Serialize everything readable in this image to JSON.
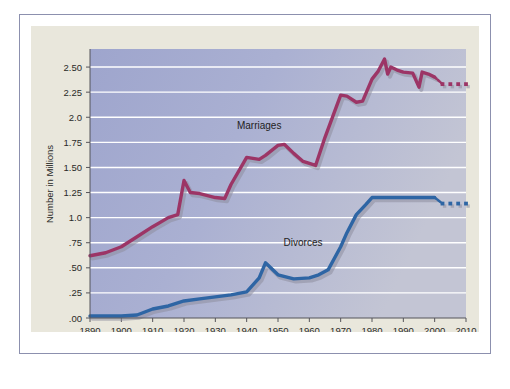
{
  "chart_data": {
    "type": "line",
    "title": "",
    "xlabel": "Year",
    "ylabel": "Number in Millions",
    "xlim": [
      1890,
      2010
    ],
    "ylim": [
      0,
      2.68
    ],
    "grid": true,
    "legend_position": "inline-annotation",
    "x_ticks": [
      "1890",
      "1900",
      "1910",
      "1920",
      "1930",
      "1940",
      "1950",
      "1960",
      "1970",
      "1980",
      "1990",
      "2000",
      "2010"
    ],
    "y_ticks": [
      ".00",
      ".25",
      ".50",
      ".75",
      "1.0",
      "1.25",
      "1.50",
      "1.75",
      "2.0",
      "2.25",
      "2.50"
    ],
    "y_tick_values": [
      0,
      0.25,
      0.5,
      0.75,
      1.0,
      1.25,
      1.5,
      1.75,
      2.0,
      2.25,
      2.5
    ],
    "colors": {
      "marriages": "#9c3566",
      "divorces": "#2e65a4",
      "plot_background": "#a9aed0",
      "gridline": "#ffffff",
      "figure_background": "#e9e7dc",
      "frame_border": "#8c90ae",
      "shadow": "#8e8e9e"
    },
    "series": [
      {
        "name": "Marriages",
        "color": "#9c3566",
        "label_x": 1944,
        "label_y": 1.88,
        "points": [
          [
            1890,
            0.62
          ],
          [
            1895,
            0.65
          ],
          [
            1900,
            0.71
          ],
          [
            1905,
            0.81
          ],
          [
            1910,
            0.91
          ],
          [
            1915,
            1.0
          ],
          [
            1918,
            1.03
          ],
          [
            1920,
            1.37
          ],
          [
            1922,
            1.25
          ],
          [
            1925,
            1.24
          ],
          [
            1930,
            1.2
          ],
          [
            1933,
            1.19
          ],
          [
            1935,
            1.33
          ],
          [
            1940,
            1.6
          ],
          [
            1944,
            1.58
          ],
          [
            1946,
            1.62
          ],
          [
            1950,
            1.72
          ],
          [
            1952,
            1.73
          ],
          [
            1955,
            1.64
          ],
          [
            1958,
            1.56
          ],
          [
            1962,
            1.52
          ],
          [
            1965,
            1.8
          ],
          [
            1970,
            2.22
          ],
          [
            1972,
            2.21
          ],
          [
            1975,
            2.15
          ],
          [
            1977,
            2.16
          ],
          [
            1980,
            2.38
          ],
          [
            1982,
            2.46
          ],
          [
            1984,
            2.58
          ],
          [
            1985,
            2.43
          ],
          [
            1986,
            2.5
          ],
          [
            1988,
            2.47
          ],
          [
            1990,
            2.45
          ],
          [
            1993,
            2.44
          ],
          [
            1995,
            2.3
          ],
          [
            1996,
            2.45
          ],
          [
            1998,
            2.43
          ],
          [
            2000,
            2.4
          ]
        ],
        "projection": {
          "from": [
            2000,
            2.4
          ],
          "markers": [
            [
              2002.5,
              2.33
            ],
            [
              2005,
              2.33
            ],
            [
              2007.5,
              2.33
            ],
            [
              2010,
              2.33
            ]
          ]
        }
      },
      {
        "name": "Divorces",
        "color": "#2e65a4",
        "label_x": 1958,
        "label_y": 0.72,
        "points": [
          [
            1890,
            0.02
          ],
          [
            1900,
            0.02
          ],
          [
            1905,
            0.03
          ],
          [
            1910,
            0.09
          ],
          [
            1915,
            0.12
          ],
          [
            1920,
            0.17
          ],
          [
            1925,
            0.19
          ],
          [
            1930,
            0.21
          ],
          [
            1935,
            0.23
          ],
          [
            1940,
            0.26
          ],
          [
            1944,
            0.4
          ],
          [
            1946,
            0.55
          ],
          [
            1950,
            0.43
          ],
          [
            1955,
            0.39
          ],
          [
            1960,
            0.4
          ],
          [
            1963,
            0.43
          ],
          [
            1966,
            0.48
          ],
          [
            1970,
            0.71
          ],
          [
            1972,
            0.85
          ],
          [
            1975,
            1.03
          ],
          [
            1978,
            1.13
          ],
          [
            1980,
            1.2
          ],
          [
            1985,
            1.2
          ],
          [
            1990,
            1.2
          ],
          [
            1995,
            1.2
          ],
          [
            2000,
            1.2
          ]
        ],
        "projection": {
          "from": [
            2000,
            1.2
          ],
          "markers": [
            [
              2002.5,
              1.14
            ],
            [
              2005,
              1.14
            ],
            [
              2007.5,
              1.14
            ],
            [
              2010,
              1.14
            ]
          ]
        }
      }
    ]
  }
}
